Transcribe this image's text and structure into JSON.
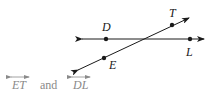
{
  "diagram": {
    "points": {
      "D": "D",
      "T": "T",
      "L": "L",
      "E": "E"
    },
    "lines": [
      {
        "name": "line-DL",
        "through": [
          "D",
          "L"
        ]
      },
      {
        "name": "line-ET",
        "through": [
          "E",
          "T"
        ]
      }
    ]
  },
  "caption": {
    "first": "ET",
    "connector": "and",
    "second": "DL"
  },
  "colors": {
    "figure": "#1a1a1a",
    "caption": "#8a8a8a"
  }
}
